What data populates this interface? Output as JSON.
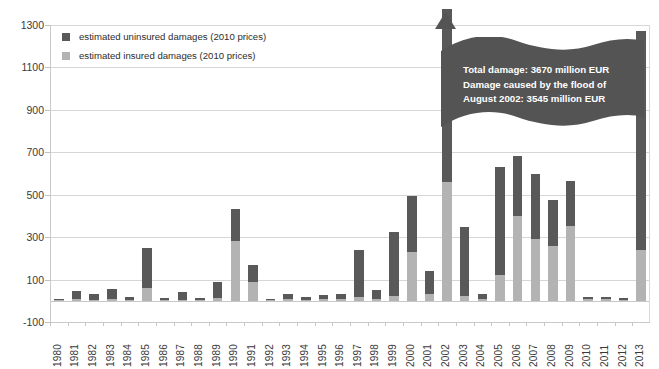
{
  "chart_data": {
    "type": "bar",
    "subtype": "stacked-vertical",
    "title": "",
    "xlabel": "",
    "ylabel": "",
    "ylim": [
      -100,
      1300
    ],
    "ytick_step": 200,
    "yticks": [
      1300,
      1100,
      900,
      700,
      500,
      300,
      100,
      -100
    ],
    "ytick_labels": [
      "1300",
      "1100",
      "900",
      "700",
      "500",
      "300",
      "100",
      "-100"
    ],
    "grid": true,
    "grid_axis": "y",
    "legend_position": "top-left",
    "categories": [
      "1980",
      "1981",
      "1982",
      "1983",
      "1984",
      "1985",
      "1986",
      "1987",
      "1988",
      "1989",
      "1990",
      "1991",
      "1992",
      "1993",
      "1994",
      "1995",
      "1996",
      "1997",
      "1998",
      "1999",
      "2000",
      "2001",
      "2002",
      "2003",
      "2004",
      "2005",
      "2006",
      "2007",
      "2008",
      "2009",
      "2010",
      "2011",
      "2012",
      "2013"
    ],
    "series": [
      {
        "name": "estimated insured damages (2010 prices)",
        "color": "#b3b3b3",
        "values": [
          2,
          8,
          6,
          10,
          4,
          60,
          3,
          6,
          5,
          14,
          280,
          90,
          3,
          8,
          5,
          7,
          9,
          18,
          7,
          22,
          230,
          30,
          560,
          25,
          7,
          120,
          400,
          290,
          260,
          355,
          8,
          7,
          6,
          240
        ]
      },
      {
        "name": "estimated uninsured damages (2010 prices)",
        "color": "#595959",
        "values": [
          3,
          37,
          27,
          45,
          14,
          190,
          7,
          36,
          10,
          76,
          155,
          80,
          3,
          22,
          13,
          20,
          22,
          222,
          42,
          303,
          265,
          110,
          3110,
          325,
          23,
          510,
          285,
          310,
          215,
          210,
          8,
          10,
          6,
          1030
        ]
      }
    ],
    "totals": [
      5,
      45,
      33,
      55,
      18,
      250,
      10,
      42,
      15,
      90,
      435,
      170,
      6,
      30,
      18,
      27,
      31,
      240,
      49,
      325,
      495,
      140,
      3670,
      350,
      30,
      630,
      685,
      600,
      475,
      565,
      16,
      17,
      12,
      1270
    ],
    "annotations": [
      {
        "name": "flood-2002-callout",
        "attached_to": "2002",
        "shape": "wavy-flag",
        "arrow": "up",
        "lines": [
          "Total damage: 3670 million EUR",
          "Damage caused by the flood of",
          "August 2002:  3545 million EUR"
        ]
      }
    ]
  },
  "legend": {
    "items": [
      {
        "label": "estimated uninsured damages (2010 prices)",
        "color": "#595959"
      },
      {
        "label": "estimated insured damages (2010 prices)",
        "color": "#b3b3b3"
      }
    ]
  },
  "colors": {
    "insured": "#b3b3b3",
    "uninsured": "#595959",
    "gridline": "#d6d6d6",
    "axis": "#c9c9c9",
    "annotation_fill": "#545454",
    "annotation_text": "#ffffff",
    "tick_text": "#3a3a3a"
  }
}
